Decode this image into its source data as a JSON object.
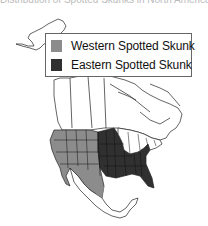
{
  "title": "Distribution of Spotted Skunks in North America",
  "legend": {
    "items": [
      {
        "label": "Western Spotted Skunk",
        "color": "#8c8c8c"
      },
      {
        "label": "Eastern Spotted Skunk",
        "color": "#303030"
      }
    ]
  },
  "map": {
    "region": "North America",
    "ranges": [
      {
        "species": "Western Spotted Skunk",
        "area": "Western United States and western Mexico",
        "color": "#8c8c8c"
      },
      {
        "species": "Eastern Spotted Skunk",
        "area": "Central and southeastern United States",
        "color": "#303030"
      }
    ]
  }
}
